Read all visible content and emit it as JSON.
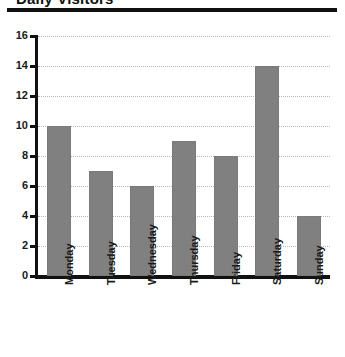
{
  "title_fragment": "Daily Visitors",
  "chart_data": {
    "type": "bar",
    "title": "",
    "xlabel": "",
    "ylabel": "",
    "categories": [
      "Monday",
      "Tuesday",
      "Wednesday",
      "Thursday",
      "Friday",
      "Saturday",
      "Sunday"
    ],
    "values": [
      10,
      7,
      6,
      9,
      8,
      14,
      4
    ],
    "ylim": [
      0,
      16
    ],
    "yticks": [
      0,
      2,
      4,
      6,
      8,
      10,
      12,
      14,
      16
    ],
    "ytick_labels": [
      "0",
      "2",
      "4",
      "6",
      "8",
      "10",
      "12",
      "14",
      "16"
    ],
    "grid": true,
    "grid_axis": "y",
    "legend": false,
    "bar_color": "#808080",
    "axis_color": "#111111",
    "grid_color": "#b9b9b9",
    "background": "#ffffff"
  }
}
